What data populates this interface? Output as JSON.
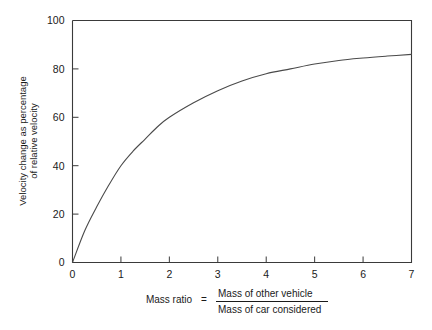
{
  "chart_data": {
    "type": "line",
    "title": "",
    "xlabel": "Mass ratio = Mass of other vehicle / Mass of car considered",
    "ylabel": "Velocity change as percentage of relative velocity",
    "xlim": [
      0,
      7
    ],
    "ylim": [
      0,
      100
    ],
    "grid": false,
    "legend": null,
    "xticks": [
      "0",
      "1",
      "2",
      "3",
      "4",
      "5",
      "6",
      "7"
    ],
    "xtick_values": [
      0,
      1,
      2,
      3,
      4,
      5,
      6,
      7
    ],
    "yticks": [
      "0",
      "20",
      "40",
      "60",
      "80",
      "100"
    ],
    "ytick_values": [
      0,
      20,
      40,
      60,
      80,
      100
    ],
    "series": [
      {
        "name": "Velocity change vs mass ratio",
        "x": [
          0,
          0.25,
          0.5,
          0.75,
          1,
          1.25,
          1.5,
          1.75,
          2,
          2.5,
          3,
          3.5,
          4,
          4.5,
          5,
          5.5,
          6,
          6.5,
          7
        ],
        "values": [
          0,
          13,
          23,
          32,
          40,
          46,
          51,
          56,
          60,
          66,
          71,
          75,
          78,
          80,
          82,
          83.5,
          84.5,
          85.3,
          86
        ]
      }
    ]
  },
  "axes": {
    "y_label_line1": "Velocity change as percentage",
    "y_label_line2": "of relative velocity"
  },
  "caption": {
    "lead": "Mass ratio",
    "equals": "=",
    "numerator": "Mass of other vehicle",
    "denominator": "Mass of car considered"
  },
  "colors": {
    "curve": "#4a4a4a",
    "frame": "#3a3a3a",
    "text": "#1a1a1a",
    "background": "#ffffff"
  }
}
